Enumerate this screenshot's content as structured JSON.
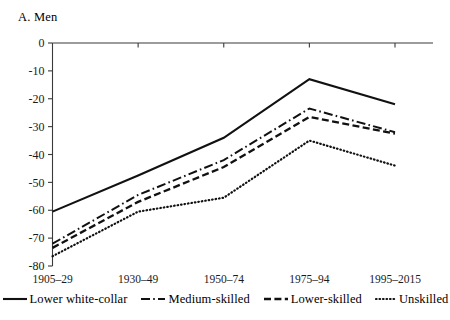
{
  "chart_data": {
    "type": "line",
    "title": "A. Men",
    "xlabel": "",
    "ylabel": "",
    "categories": [
      "1905–29",
      "1930–49",
      "1950–74",
      "1975–94",
      "1995–2015"
    ],
    "ylim": [
      -80,
      0
    ],
    "yticks": [
      0,
      -10,
      -20,
      -30,
      -40,
      -50,
      -60,
      -70,
      -80
    ],
    "ytick_labels": [
      "0",
      "-10",
      "-20",
      "-30",
      "-40",
      "-50",
      "-60",
      "-70",
      "-80"
    ],
    "grid": false,
    "legend_position": "bottom",
    "series": [
      {
        "name": "Lower white-collar",
        "style": "solid",
        "values": [
          -60.5,
          -47.5,
          -34.0,
          -13.0,
          -22.0
        ]
      },
      {
        "name": "Medium-skilled",
        "style": "dash-dot",
        "values": [
          -72.0,
          -54.5,
          -42.0,
          -23.5,
          -32.0
        ]
      },
      {
        "name": "Lower-skilled",
        "style": "dashed",
        "values": [
          -73.5,
          -57.0,
          -44.5,
          -26.5,
          -32.5
        ]
      },
      {
        "name": "Unskilled",
        "style": "dotted",
        "values": [
          -76.5,
          -60.5,
          -55.5,
          -35.0,
          -44.0
        ]
      }
    ]
  },
  "legend": {
    "items": [
      {
        "label": "Lower white-collar",
        "style": "solid"
      },
      {
        "label": "Medium-skilled",
        "style": "dash-dot"
      },
      {
        "label": "Lower-skilled",
        "style": "dashed"
      },
      {
        "label": "Unskilled",
        "style": "dotted"
      }
    ]
  }
}
